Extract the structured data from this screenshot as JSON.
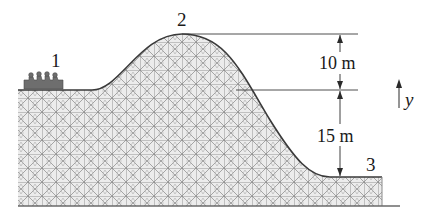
{
  "diagram": {
    "points": [
      {
        "id": "1",
        "label": "1"
      },
      {
        "id": "2",
        "label": "2"
      },
      {
        "id": "3",
        "label": "3"
      }
    ],
    "dimensions": [
      {
        "label": "10 m",
        "from": "point 2 height",
        "to": "point 1 height"
      },
      {
        "label": "15 m",
        "from": "point 1 height",
        "to": "point 3 height"
      }
    ],
    "axis": {
      "label": "y",
      "direction": "up"
    },
    "colors": {
      "line": "#3a3a3a",
      "lattice": "#9a9a9a",
      "lattice_fill": "#e6e6e6",
      "car": "#6e6e6e"
    }
  }
}
